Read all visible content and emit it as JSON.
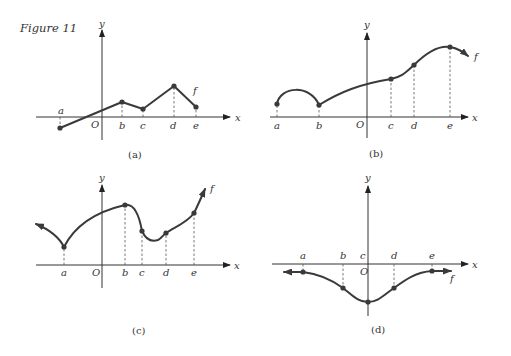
{
  "figure_title": "Figure 11",
  "axis_labels": {
    "x": "x",
    "y": "y",
    "origin": "O"
  },
  "function_label": "f",
  "panels": [
    {
      "caption": "(a)",
      "description": "Piecewise-linear graph through points a,b,c,d,e; endpoints a and e closed dots",
      "points": [
        "a",
        "b",
        "c",
        "d",
        "e"
      ]
    },
    {
      "caption": "(b)",
      "description": "Hump from a to b, then rising smooth curve through c, d, maximum at e, arrow continuing right",
      "points": [
        "a",
        "b",
        "c",
        "d",
        "e"
      ]
    },
    {
      "caption": "(c)",
      "description": "Curve from upper-left arrow down to cusp at a, up to b, dip past c, through d, e, arrow up-right",
      "points": [
        "a",
        "b",
        "c",
        "d",
        "e"
      ]
    },
    {
      "caption": "(d)",
      "description": "Symmetric bell-shaped curve below x-axis, minimum at c on y-axis, arrows at both ends",
      "points": [
        "a",
        "b",
        "c",
        "d",
        "e"
      ]
    }
  ],
  "colors": {
    "ink": "#3a3a3a",
    "background": "#ffffff"
  }
}
